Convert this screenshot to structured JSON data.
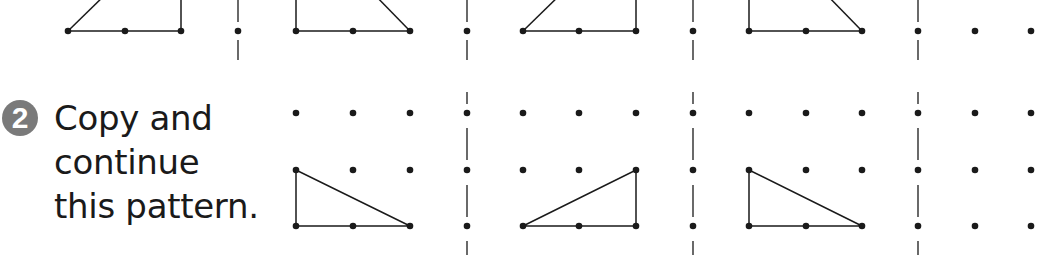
{
  "exercise": {
    "number": "2",
    "instruction_lines": [
      "Copy and",
      "continue",
      "this pattern."
    ]
  },
  "colors": {
    "ink": "#1a1a1a",
    "badge": "#7a7a7a"
  },
  "top_row": {
    "description": "Previous exercise pattern (cut off at top): alternating right triangles",
    "dot_y": 31,
    "dot_columns": [
      68,
      125,
      181,
      238,
      296,
      353,
      410,
      467,
      523,
      579,
      636,
      693,
      749,
      806,
      862,
      918,
      975,
      1031
    ]
  },
  "bottom_grid": {
    "dot_rows_y": [
      113,
      170,
      226
    ],
    "dot_columns": [
      296,
      353,
      410,
      467,
      523,
      579,
      636,
      693,
      749,
      806,
      862,
      918,
      975,
      1031
    ],
    "separators_x": [
      467,
      693,
      918
    ],
    "shapes": [
      {
        "name": "triangle-1",
        "points": [
          [
            296,
            170
          ],
          [
            296,
            226
          ],
          [
            410,
            226
          ]
        ]
      },
      {
        "name": "triangle-2",
        "points": [
          [
            523,
            226
          ],
          [
            636,
            226
          ],
          [
            636,
            170
          ]
        ]
      },
      {
        "name": "triangle-3",
        "points": [
          [
            749,
            170
          ],
          [
            749,
            226
          ],
          [
            862,
            226
          ]
        ]
      }
    ]
  }
}
